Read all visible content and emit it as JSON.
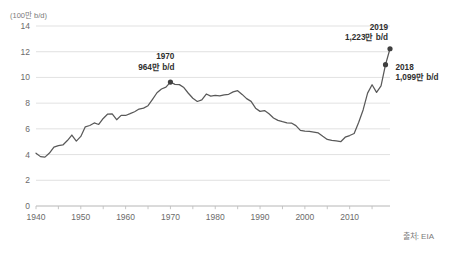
{
  "chart_data": {
    "type": "line",
    "title": "",
    "subtitle": "",
    "unit_label": "(100만 b/d)",
    "xlabel": "",
    "ylabel": "",
    "xlim": [
      1940,
      2019
    ],
    "ylim": [
      0,
      14
    ],
    "grid": true,
    "legend": null,
    "source": "출처: EIA",
    "line_color": "#595959",
    "grid_color": "#d9d9d9",
    "axis_color": "#bfbfbf",
    "marker_color": "#404040",
    "y_ticks": [
      0,
      2,
      4,
      6,
      8,
      10,
      12,
      14
    ],
    "y_tick_labels": [
      "0",
      "2",
      "4",
      "6",
      "8",
      "10",
      "12",
      "14"
    ],
    "x_ticks": [
      1940,
      1950,
      1960,
      1970,
      1980,
      1990,
      2000,
      2010
    ],
    "x_tick_labels": [
      "1940",
      "1950",
      "1960",
      "1970",
      "1980",
      "1990",
      "2000",
      "2010"
    ],
    "x_minor_ticks": [
      1945,
      1955,
      1965,
      1975,
      1985,
      1995,
      2005,
      2015
    ],
    "series": [
      {
        "name": "US crude oil production",
        "x": [
          1940,
          1941,
          1942,
          1943,
          1944,
          1945,
          1946,
          1947,
          1948,
          1949,
          1950,
          1951,
          1952,
          1953,
          1954,
          1955,
          1956,
          1957,
          1958,
          1959,
          1960,
          1961,
          1962,
          1963,
          1964,
          1965,
          1966,
          1967,
          1968,
          1969,
          1970,
          1971,
          1972,
          1973,
          1974,
          1975,
          1976,
          1977,
          1978,
          1979,
          1980,
          1981,
          1982,
          1983,
          1984,
          1985,
          1986,
          1987,
          1988,
          1989,
          1990,
          1991,
          1992,
          1993,
          1994,
          1995,
          1996,
          1997,
          1998,
          1999,
          2000,
          2001,
          2002,
          2003,
          2004,
          2005,
          2006,
          2007,
          2008,
          2009,
          2010,
          2011,
          2012,
          2013,
          2014,
          2015,
          2016,
          2017,
          2018,
          2019
        ],
        "values": [
          4.11,
          3.84,
          3.8,
          4.12,
          4.58,
          4.7,
          4.75,
          5.09,
          5.52,
          5.05,
          5.41,
          6.16,
          6.26,
          6.46,
          6.34,
          6.81,
          7.15,
          7.17,
          6.71,
          7.05,
          7.04,
          7.18,
          7.33,
          7.54,
          7.61,
          7.8,
          8.3,
          8.81,
          9.1,
          9.24,
          9.64,
          9.46,
          9.44,
          9.21,
          8.77,
          8.38,
          8.13,
          8.25,
          8.71,
          8.55,
          8.6,
          8.57,
          8.65,
          8.69,
          8.88,
          8.97,
          8.68,
          8.35,
          8.14,
          7.61,
          7.36,
          7.42,
          7.17,
          6.85,
          6.66,
          6.56,
          6.47,
          6.45,
          6.25,
          5.88,
          5.82,
          5.8,
          5.75,
          5.68,
          5.42,
          5.18,
          5.1,
          5.06,
          5.0,
          5.35,
          5.48,
          5.64,
          6.5,
          7.47,
          8.78,
          9.43,
          8.84,
          9.35,
          10.99,
          12.23
        ]
      }
    ],
    "annotations": [
      {
        "name": "annotation-1970",
        "year_label": "1970",
        "value_label": "964만 b/d",
        "x": 1970,
        "y": 9.64,
        "marker": true
      },
      {
        "name": "annotation-2019",
        "year_label": "2019",
        "value_label": "1,223만 b/d",
        "x": 2019,
        "y": 12.23,
        "marker": true
      },
      {
        "name": "annotation-2018",
        "year_label": "2018",
        "value_label": "1,099만 b/d",
        "x": 2018,
        "y": 10.99,
        "marker": true
      }
    ]
  }
}
